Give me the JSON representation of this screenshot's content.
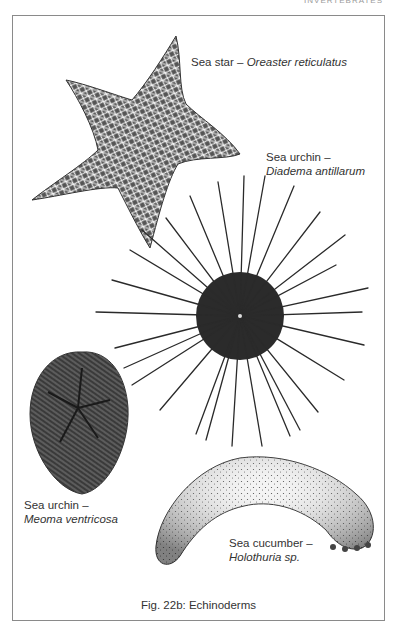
{
  "page": {
    "running_head": "INVERTEBRATES"
  },
  "figure": {
    "caption": "Fig. 22b: Echinoderms",
    "specimens": [
      {
        "common_name": "Sea star –",
        "scientific_name": "Oreaster reticulatus"
      },
      {
        "common_name": "Sea urchin –",
        "scientific_name": "Diadema antillarum"
      },
      {
        "common_name": "Sea urchin –",
        "scientific_name": "Meoma ventricosa"
      },
      {
        "common_name": "Sea cucumber –",
        "scientific_name": "Holothuria sp."
      }
    ]
  },
  "colors": {
    "frame": "#8a8a8a",
    "ink": "#2a2a2a",
    "text": "#333333"
  }
}
